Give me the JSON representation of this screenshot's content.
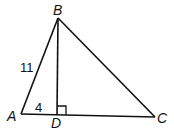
{
  "diagram": {
    "type": "triangle",
    "vertices": {
      "A": {
        "label": "A"
      },
      "B": {
        "label": "B"
      },
      "C": {
        "label": "C"
      },
      "D": {
        "label": "D"
      }
    },
    "segments": {
      "AB": {
        "label": "11"
      },
      "AD": {
        "label": "4"
      }
    },
    "right_angle_at": "D",
    "colors": {
      "stroke": "#111111",
      "background": "#ffffff"
    }
  }
}
